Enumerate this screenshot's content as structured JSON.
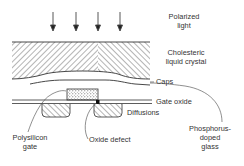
{
  "diagram": {
    "labels": {
      "polarized_light": [
        "Polarized",
        "light"
      ],
      "cholesteric": [
        "Cholesteric",
        "liquid crystal"
      ],
      "caps": "Caps",
      "gate_oxide": "Gate oxide",
      "diffusions": "Diffusions",
      "polysilicon_gate": [
        "Polysilicon",
        "gate"
      ],
      "oxide_defect": "Oxide defect",
      "phosphorus_glass": [
        "Phosphorus-",
        "doped",
        "glass"
      ]
    },
    "arrow_count": 4,
    "colors": {
      "line": "#333333",
      "background": "#ffffff",
      "defect": "#111111"
    }
  }
}
